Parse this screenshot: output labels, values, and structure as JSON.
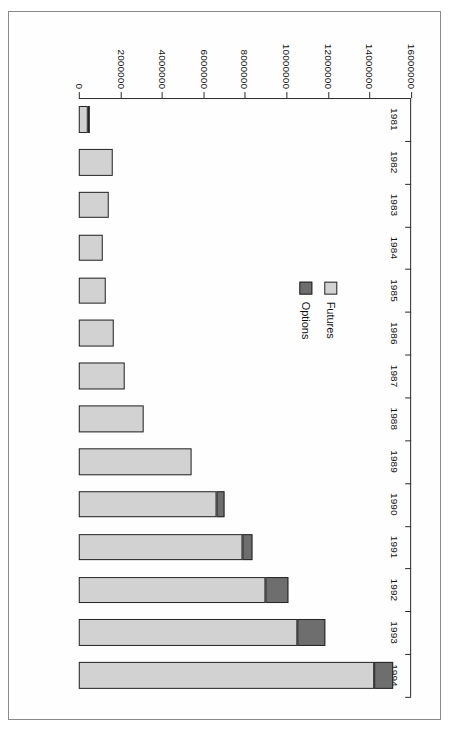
{
  "chart_data": {
    "type": "bar",
    "orientation": "horizontal",
    "stacked": true,
    "title": "",
    "xlabel": "",
    "ylabel": "Contracts",
    "value_axis_label": "Contracts",
    "categories": [
      "1981",
      "1982",
      "1983",
      "1984",
      "1985",
      "1986",
      "1987",
      "1988",
      "1989",
      "1990",
      "1991",
      "1992",
      "1993",
      "1994"
    ],
    "series": [
      {
        "name": "Futures",
        "color": "#d2d2d2",
        "values": [
          420000,
          1620000,
          1430000,
          1170000,
          1280000,
          1670000,
          2200000,
          3100000,
          5450000,
          6650000,
          7900000,
          9000000,
          10500000,
          14200000
        ]
      },
      {
        "name": "Options",
        "color": "#6e6e6e",
        "values": [
          120000,
          0,
          0,
          0,
          0,
          0,
          0,
          0,
          0,
          350000,
          450000,
          1100000,
          1350000,
          950000
        ]
      }
    ],
    "totals": [
      540000,
      1620000,
      1430000,
      1170000,
      1280000,
      1670000,
      2200000,
      3100000,
      5450000,
      7000000,
      8350000,
      10100000,
      11850000,
      15150000
    ],
    "value_ticks": [
      0,
      2000000,
      4000000,
      6000000,
      8000000,
      10000000,
      12000000,
      14000000,
      16000000
    ],
    "value_tick_labels": [
      "0",
      "2000000",
      "4000000",
      "6000000",
      "8000000",
      "10000000",
      "12000000",
      "14000000",
      "16000000"
    ],
    "vlim": [
      0,
      16000000
    ],
    "grid": false,
    "legend_position": "inside-left",
    "legend": [
      {
        "label": "Futures",
        "color": "#d2d2d2"
      },
      {
        "label": "Options",
        "color": "#6e6e6e"
      }
    ]
  },
  "figure": {
    "border_color": "#8a8a8a",
    "background": "#ffffff",
    "rotation_degrees": 90
  }
}
